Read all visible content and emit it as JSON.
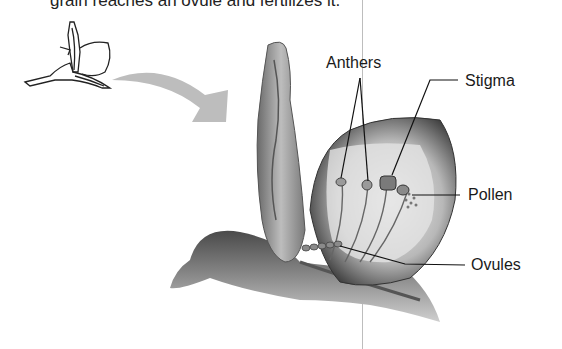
{
  "caption": "grain reaches an ovule and fertilizes it.",
  "diagram": {
    "icons": [
      "small-flower-outline",
      "curved-arrow",
      "flower-cross-section"
    ],
    "labels": {
      "anthers": "Anthers",
      "stigma": "Stigma",
      "pollen": "Pollen",
      "ovules": "Ovules"
    }
  }
}
